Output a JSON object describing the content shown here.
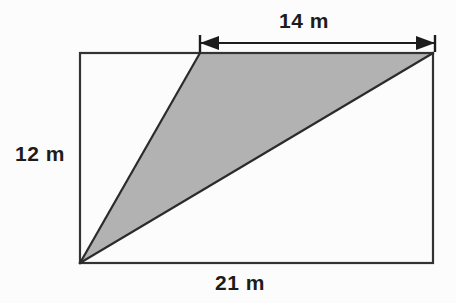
{
  "figure": {
    "background_color": "#fcfcfc",
    "stroke_color": "#333333",
    "shade_color": "#b2b2b2",
    "units": "m"
  },
  "labels": {
    "top": "14 m",
    "left": "12 m",
    "bottom": "21 m"
  },
  "chart_data": {
    "type": "diagram",
    "shape": "rectangle-with-inscribed-shaded-triangle",
    "units": "m",
    "rectangle": {
      "width_label": "21 m",
      "height_label": "12 m",
      "width_value": 21,
      "height_value": 12,
      "px": {
        "x": 80,
        "y": 53,
        "w": 353,
        "h": 210
      }
    },
    "dimension_arrow": {
      "label": "14 m",
      "value": 14,
      "orientation": "horizontal",
      "placement": "above-rectangle-top-edge",
      "px": {
        "x1": 200,
        "x2": 435,
        "y": 43
      },
      "arrowheads": "both",
      "end_ticks": true
    },
    "shaded_triangle": {
      "fill": "#b2b2b2",
      "vertices_px": [
        {
          "x": 80,
          "y": 263
        },
        {
          "x": 200,
          "y": 53
        },
        {
          "x": 433,
          "y": 53
        }
      ],
      "vertex_descriptions": [
        "bottom-left corner of rectangle",
        "point on top edge, 14 m from top-right corner",
        "top-right corner of rectangle"
      ],
      "base_label": "14 m",
      "base_value": 14,
      "height_label": "12 m",
      "height_value": 12
    },
    "annotations": [
      {
        "text": "14 m",
        "position": "top"
      },
      {
        "text": "12 m",
        "position": "left"
      },
      {
        "text": "21 m",
        "position": "bottom"
      }
    ]
  }
}
